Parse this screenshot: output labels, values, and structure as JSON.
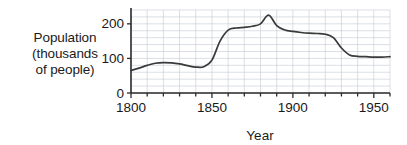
{
  "ylabel_lines": [
    "Population",
    "(thousands",
    "of people)"
  ],
  "chart_data": {
    "type": "line",
    "title": "",
    "xlabel": "Year",
    "ylabel": "Population (thousands of people)",
    "xlim": [
      1800,
      1960
    ],
    "ylim": [
      0,
      240
    ],
    "xticks": [
      1800,
      1850,
      1900,
      1950
    ],
    "xtick_labels": [
      "1800",
      "1850",
      "1900",
      "1950"
    ],
    "xminor_step": 10,
    "yticks": [
      0,
      100,
      200
    ],
    "ytick_labels": [
      "0",
      "100",
      "200"
    ],
    "yminor_step": 20,
    "grid": true,
    "legend": "none",
    "units": "thousands of people",
    "series": [
      {
        "name": "Population",
        "x": [
          1800,
          1805,
          1810,
          1815,
          1820,
          1825,
          1830,
          1835,
          1840,
          1845,
          1850,
          1855,
          1860,
          1865,
          1870,
          1875,
          1880,
          1885,
          1890,
          1895,
          1900,
          1905,
          1910,
          1915,
          1920,
          1925,
          1930,
          1935,
          1940,
          1945,
          1950,
          1955,
          1960
        ],
        "values": [
          65,
          72,
          80,
          86,
          88,
          87,
          84,
          79,
          75,
          76,
          95,
          150,
          182,
          188,
          190,
          193,
          200,
          225,
          195,
          182,
          178,
          175,
          173,
          172,
          170,
          160,
          130,
          110,
          106,
          105,
          104,
          104,
          105
        ]
      }
    ],
    "annotations": [
      {
        "label": "peak",
        "x": 1885,
        "y": 225
      },
      {
        "label": "local-max",
        "x": 1820,
        "y": 88
      },
      {
        "label": "local-min",
        "x": 1840,
        "y": 75
      },
      {
        "label": "start",
        "x": 1800,
        "y": 65
      },
      {
        "label": "end",
        "x": 1960,
        "y": 105
      }
    ],
    "colors": {
      "line": "#3a3a3a",
      "grid": "#c3c9d4",
      "axis": "#2b2b2b",
      "background": "#ffffff",
      "text": "#1a1a1a"
    }
  }
}
